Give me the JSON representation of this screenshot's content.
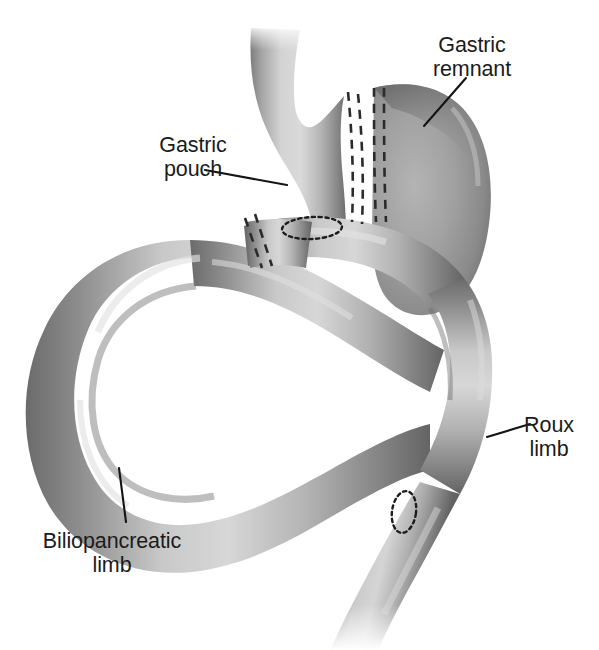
{
  "figure": {
    "background_color": "#ffffff",
    "ink_color": "#1b1b1b",
    "style": "grayscale medical line illustration with airbrush shading"
  },
  "labels": [
    {
      "id": "gastric-remnant",
      "line1": "Gastric",
      "line2": "remnant",
      "text_x": 472,
      "text_y": 52,
      "anchor": "middle",
      "leader": "M 466 78 L 424 126"
    },
    {
      "id": "gastric-pouch",
      "line1": "Gastric",
      "line2": "pouch",
      "text_x": 193,
      "text_y": 152,
      "anchor": "middle",
      "leader": "M 205 170 L 287 185"
    },
    {
      "id": "roux-limb",
      "line1": "Roux",
      "line2": "limb",
      "text_x": 549,
      "text_y": 432,
      "anchor": "middle",
      "leader": "M 530 424 L 487 437"
    },
    {
      "id": "biliopancreatic-limb",
      "line1": "Biliopancreatic",
      "line2": "limb",
      "text_x": 112,
      "text_y": 548,
      "anchor": "middle",
      "leader": "M 126 522 L 119 468"
    }
  ],
  "structures": [
    {
      "id": "esophagus",
      "name": "Esophagus"
    },
    {
      "id": "gastric-pouch-body",
      "name": "Gastric pouch"
    },
    {
      "id": "gastric-remnant-body",
      "name": "Gastric remnant"
    },
    {
      "id": "roux-limb-tube",
      "name": "Roux limb"
    },
    {
      "id": "biliopancreatic-limb-tube",
      "name": "Biliopancreatic limb"
    },
    {
      "id": "common-channel",
      "name": "Common channel"
    }
  ],
  "surgical_marks": [
    {
      "id": "staple-line-pouch",
      "name": "Pouch division staple line",
      "type": "double-dashed-line"
    },
    {
      "id": "staple-line-remnant",
      "name": "Remnant division staple line",
      "type": "double-dashed-line"
    },
    {
      "id": "staple-line-roux-stump",
      "name": "Roux limb closed stump staple line",
      "type": "double-dashed-line"
    },
    {
      "id": "gastrojejunostomy",
      "name": "Gastrojejunostomy anastomosis",
      "type": "dotted-ellipse"
    },
    {
      "id": "jejunojejunostomy",
      "name": "Jejunojejunostomy anastomosis",
      "type": "dotted-ellipse"
    }
  ],
  "palette": {
    "tissue_light": "#dedede",
    "tissue_mid": "#a9a9a9",
    "tissue_dark": "#6f6f6f",
    "tissue_edge": "#5d5d5d",
    "remnant_mid": "#9a9a9a",
    "stroke": "#1b1b1b"
  }
}
